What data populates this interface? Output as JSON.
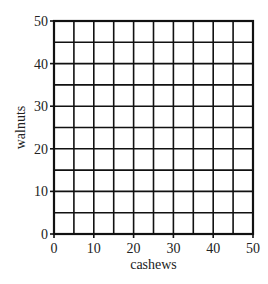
{
  "chart_data": {
    "type": "scatter",
    "title": "",
    "xlabel": "cashews",
    "ylabel": "walnuts",
    "xlim": [
      0,
      50
    ],
    "ylim": [
      0,
      50
    ],
    "x_ticks": [
      0,
      10,
      20,
      30,
      40,
      50
    ],
    "y_ticks": [
      0,
      10,
      20,
      30,
      40,
      50
    ],
    "x_tick_labels": [
      "0",
      "10",
      "20",
      "30",
      "40",
      "50"
    ],
    "y_tick_labels": [
      "0",
      "10",
      "20",
      "30",
      "40",
      "50"
    ],
    "grid": true,
    "grid_step": 5,
    "series": [],
    "legend": null,
    "colors": {
      "grid": "#111111",
      "background": "#ffffff"
    }
  }
}
